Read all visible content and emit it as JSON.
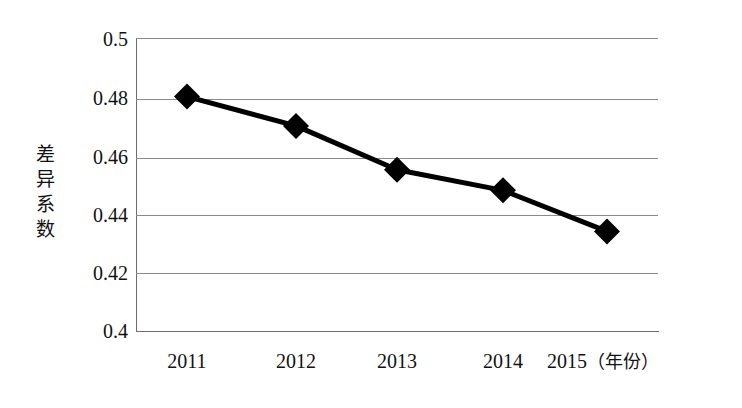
{
  "chart_data": {
    "type": "line",
    "title": "",
    "xlabel": "年份",
    "ylabel": "差异系数",
    "categories": [
      "2011",
      "2012",
      "2013",
      "2014",
      "2015"
    ],
    "values": [
      0.48,
      0.47,
      0.455,
      0.448,
      0.434
    ],
    "series": [
      {
        "name": "差异系数",
        "values": [
          0.48,
          0.47,
          0.455,
          0.448,
          0.434
        ]
      }
    ],
    "ylim": [
      0.4,
      0.5
    ],
    "yticks": [
      "0.5",
      "0.48",
      "0.46",
      "0.44",
      "0.42",
      "0.4"
    ],
    "ytick_values": [
      0.5,
      0.48,
      0.46,
      0.44,
      0.42,
      0.4
    ],
    "grid": true,
    "legend": false,
    "marker": "diamond",
    "line_color": "#000000",
    "marker_color": "#000000",
    "grid_color": "#8a8a8a",
    "axis_color": "#6d6d6d",
    "background": "#ffffff"
  },
  "axes": {
    "y_title_stacked": "差\n异\n系\n数",
    "x_unit_label": "（年份）"
  }
}
